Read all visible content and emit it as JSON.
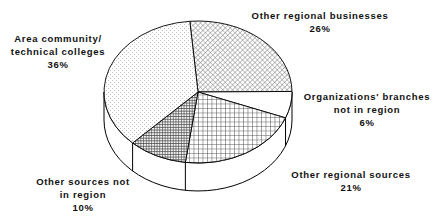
{
  "figure": {
    "background_color": "#ffffff",
    "outline_color": "#000000",
    "style": "monochrome 3d extruded pie chart with pattern fills"
  },
  "chart_data": {
    "type": "pie",
    "title": "",
    "legend_position": "none",
    "labels_position": "around-pie",
    "start": "12 o'clock, clockwise",
    "categories": [
      "Other regional businesses",
      "Organizations' branches not in region",
      "Other regional sources",
      "Other sources not in region",
      "Area community/technical colleges"
    ],
    "values": [
      26,
      6,
      21,
      10,
      36
    ],
    "slices": [
      {
        "label": "Other regional businesses",
        "value_pct": 26,
        "pattern": "diagonal-hatch",
        "label_lines": [
          "Other regional businesses",
          "26%"
        ]
      },
      {
        "label": "Organizations' branches not in region",
        "value_pct": 6,
        "pattern": "solid-white",
        "label_lines": [
          "Organizations' branches",
          "not in region",
          "6%"
        ]
      },
      {
        "label": "Other regional sources",
        "value_pct": 21,
        "pattern": "grid",
        "label_lines": [
          "Other regional sources",
          "21%"
        ]
      },
      {
        "label": "Other sources not in region",
        "value_pct": 10,
        "pattern": "dense-grid-dark",
        "label_lines": [
          "Other sources not",
          "in region",
          "10%"
        ]
      },
      {
        "label": "Area community/technical colleges",
        "value_pct": 36,
        "pattern": "light-dots",
        "label_lines": [
          "Area community/",
          "technical colleges",
          "36%"
        ]
      }
    ]
  }
}
